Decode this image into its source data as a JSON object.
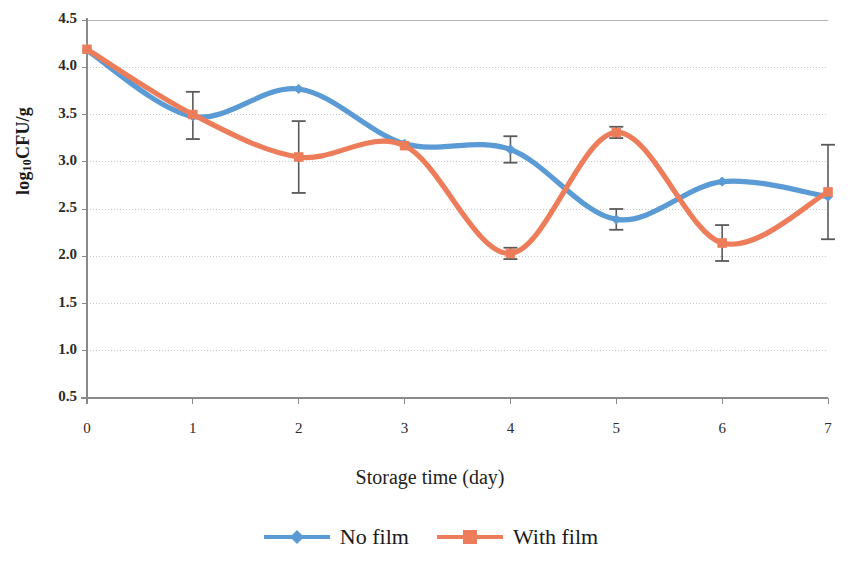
{
  "chart_data": {
    "type": "line",
    "title": "",
    "xlabel": "Storage time (day)",
    "ylabel": "log₁₀CFU/g",
    "ylabel_main": "log",
    "ylabel_sub": "10",
    "ylabel_tail": "CFU/g",
    "x": [
      0,
      1,
      2,
      3,
      4,
      5,
      6,
      7
    ],
    "xlim": [
      0,
      7
    ],
    "ylim": [
      0.5,
      4.5
    ],
    "xticks": [
      "0",
      "1",
      "2",
      "3",
      "4",
      "5",
      "6",
      "7"
    ],
    "yticks": [
      "0.5",
      "1.0",
      "1.5",
      "2.0",
      "2.5",
      "3.0",
      "3.5",
      "4.0",
      "4.5"
    ],
    "ytick_values": [
      0.5,
      1.0,
      1.5,
      2.0,
      2.5,
      3.0,
      3.5,
      4.0,
      4.5
    ],
    "grid": "horizontal-dashed",
    "smoothed": true,
    "legend_position": "bottom-center",
    "series": [
      {
        "name": "No film",
        "color": "#5B9BD5",
        "marker": "diamond",
        "values": [
          4.18,
          3.48,
          3.77,
          3.19,
          3.13,
          2.39,
          2.79,
          2.63
        ],
        "errors": [
          null,
          null,
          null,
          null,
          0.14,
          0.11,
          null,
          null
        ],
        "error_points": [
          {
            "x": 4,
            "low": 2.99,
            "high": 3.27
          },
          {
            "x": 5,
            "low": 2.28,
            "high": 2.5
          }
        ]
      },
      {
        "name": "With film",
        "color": "#ED7D5A",
        "marker": "square",
        "values": [
          4.19,
          3.5,
          3.05,
          3.17,
          2.03,
          3.31,
          2.14,
          2.68
        ],
        "errors": [
          null,
          0.25,
          0.38,
          null,
          0.06,
          0.06,
          0.19,
          0.5
        ],
        "error_points": [
          {
            "x": 1,
            "low": 3.24,
            "high": 3.74
          },
          {
            "x": 2,
            "low": 2.67,
            "high": 3.43
          },
          {
            "x": 4,
            "low": 1.97,
            "high": 2.09
          },
          {
            "x": 5,
            "low": 3.25,
            "high": 3.37
          },
          {
            "x": 6,
            "low": 1.95,
            "high": 2.33
          },
          {
            "x": 7,
            "low": 2.18,
            "high": 3.18
          }
        ]
      }
    ]
  },
  "legend": {
    "items": [
      {
        "label": "No film",
        "color": "#5B9BD5",
        "marker": "diamond"
      },
      {
        "label": "With film",
        "color": "#ED7D5A",
        "marker": "square"
      }
    ]
  },
  "axes": {
    "x_title": "Storage time (day)",
    "y_title_main": "log",
    "y_title_sub": "10",
    "y_title_tail": "CFU/g"
  },
  "colors": {
    "series_no_film": "#5B9BD5",
    "series_with_film": "#ED7D5A",
    "gridline": "#c9c9c9",
    "axis": "#8a8a8a",
    "errorbar": "#5a5a5a",
    "background": "#ffffff"
  }
}
